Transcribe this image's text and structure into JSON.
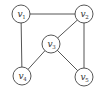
{
  "graph": {
    "nodes": [
      {
        "id": "v1",
        "base": "v",
        "sub": "1",
        "x": 21,
        "y": 14
      },
      {
        "id": "v2",
        "base": "v",
        "sub": "2",
        "x": 84,
        "y": 14
      },
      {
        "id": "v3",
        "base": "v",
        "sub": "3",
        "x": 51,
        "y": 44
      },
      {
        "id": "v4",
        "base": "v",
        "sub": "4",
        "x": 22,
        "y": 76
      },
      {
        "id": "v5",
        "base": "v",
        "sub": "5",
        "x": 84,
        "y": 77
      }
    ],
    "edges": [
      {
        "from": "v1",
        "to": "v2"
      },
      {
        "from": "v1",
        "to": "v4"
      },
      {
        "from": "v2",
        "to": "v3"
      },
      {
        "from": "v2",
        "to": "v5"
      },
      {
        "from": "v3",
        "to": "v4"
      },
      {
        "from": "v3",
        "to": "v5"
      }
    ],
    "node_radius": 9,
    "colors": {
      "edge": "#555555",
      "node_stroke": "#444444",
      "label": "#333333"
    }
  }
}
